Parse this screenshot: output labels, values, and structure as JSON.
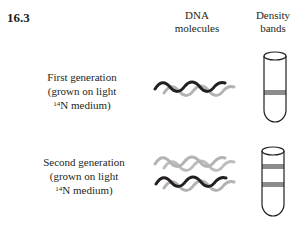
{
  "figure": {
    "number": "16.3",
    "columns": {
      "dna": [
        "DNA",
        "molecules"
      ],
      "density": [
        "Density",
        "bands"
      ]
    },
    "rows": [
      {
        "label_lines": [
          "First generation",
          "(grown on light",
          "N medium)"
        ],
        "isotope_sup": "14",
        "dna_strands": [
          {
            "pair": [
              "dark",
              "light"
            ]
          }
        ],
        "bands": [
          "intermediate"
        ]
      },
      {
        "label_lines": [
          "Second generation",
          "(grown on light",
          "N medium)"
        ],
        "isotope_sup": "14",
        "dna_strands": [
          {
            "pair": [
              "light",
              "light"
            ]
          },
          {
            "pair": [
              "dark",
              "light"
            ]
          }
        ],
        "bands": [
          "light",
          "intermediate"
        ]
      }
    ],
    "colors": {
      "dark_strand": "#231f20",
      "light_strand": "#b3b3b3",
      "band": "#8c8c8c",
      "tube_outline": "#231f20"
    }
  }
}
